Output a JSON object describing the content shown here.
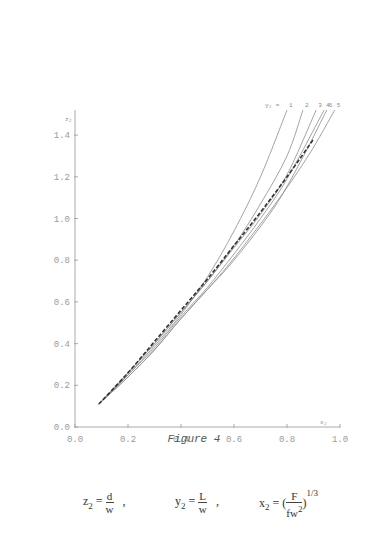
{
  "chart_data": {
    "type": "line",
    "title": "",
    "caption": "Figure 4",
    "xlabel": "x2",
    "ylabel": "z2",
    "xlim": [
      0.0,
      1.0
    ],
    "ylim": [
      0.0,
      1.5
    ],
    "x_ticks": [
      "0.0",
      "0.2",
      "0.4",
      "0.6",
      "0.8",
      "1.0"
    ],
    "y_ticks": [
      "0.0",
      "0.2",
      "0.4",
      "0.6",
      "0.8",
      "1.0",
      "1.2",
      "1.4"
    ],
    "grid": false,
    "legend_prefix": "y2 =",
    "series": [
      {
        "name": "1",
        "style": "solid",
        "x": [
          0.09,
          0.2,
          0.3,
          0.4,
          0.5,
          0.6,
          0.7,
          0.8
        ],
        "y": [
          0.11,
          0.25,
          0.39,
          0.54,
          0.72,
          0.94,
          1.2,
          1.52
        ]
      },
      {
        "name": "2",
        "style": "solid",
        "x": [
          0.09,
          0.2,
          0.3,
          0.4,
          0.5,
          0.6,
          0.7,
          0.8,
          0.86
        ],
        "y": [
          0.11,
          0.26,
          0.4,
          0.55,
          0.7,
          0.87,
          1.07,
          1.3,
          1.52
        ]
      },
      {
        "name": "3",
        "style": "solid",
        "x": [
          0.09,
          0.2,
          0.3,
          0.4,
          0.5,
          0.6,
          0.7,
          0.8,
          0.91
        ],
        "y": [
          0.11,
          0.26,
          0.4,
          0.55,
          0.7,
          0.86,
          1.02,
          1.21,
          1.52
        ]
      },
      {
        "name": "4",
        "style": "solid",
        "x": [
          0.09,
          0.2,
          0.3,
          0.4,
          0.5,
          0.6,
          0.7,
          0.8,
          0.94
        ],
        "y": [
          0.11,
          0.25,
          0.38,
          0.53,
          0.67,
          0.83,
          1.0,
          1.19,
          1.52
        ]
      },
      {
        "name": "6",
        "style": "solid",
        "x": [
          0.09,
          0.2,
          0.3,
          0.4,
          0.5,
          0.6,
          0.75,
          0.85,
          0.95
        ],
        "y": [
          0.11,
          0.24,
          0.37,
          0.52,
          0.66,
          0.8,
          1.05,
          1.27,
          1.52
        ]
      },
      {
        "name": "5",
        "style": "solid",
        "x": [
          0.09,
          0.2,
          0.3,
          0.4,
          0.5,
          0.6,
          0.75,
          0.88,
          0.98
        ],
        "y": [
          0.11,
          0.24,
          0.37,
          0.52,
          0.66,
          0.81,
          1.06,
          1.3,
          1.52
        ]
      },
      {
        "name": "reference",
        "style": "dashed",
        "x": [
          0.09,
          0.2,
          0.3,
          0.4,
          0.5,
          0.6,
          0.7,
          0.8,
          0.9
        ],
        "y": [
          0.11,
          0.26,
          0.41,
          0.56,
          0.71,
          0.87,
          1.03,
          1.2,
          1.38
        ]
      }
    ]
  },
  "caption": "Figure 4",
  "formula": {
    "z2_lhs": "z",
    "z2_sub": "2",
    "z2_num": "d",
    "z2_den": "w",
    "y2_lhs": "y",
    "y2_sub": "2",
    "y2_num": "L",
    "y2_den": "w",
    "x2_lhs": "x",
    "x2_sub": "2",
    "x2_num": "F",
    "x2_den": "fw",
    "x2_den_sup": "2",
    "x2_exp": "1/3",
    "eq": "=",
    "sep": ","
  },
  "axis_labels": {
    "x": "x₂",
    "y": "z₂",
    "legend_prefix": "y₂ = 1"
  }
}
